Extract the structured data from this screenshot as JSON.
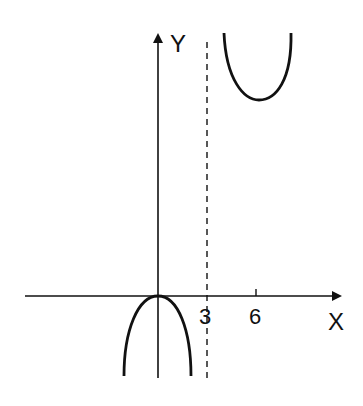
{
  "diagram": {
    "type": "function-graph-sketch",
    "axes": {
      "x_label": "X",
      "y_label": "Y"
    },
    "ticks": [
      {
        "label": "3",
        "x_value": 3
      },
      {
        "label": "6",
        "x_value": 6
      }
    ],
    "asymptote": {
      "type": "vertical",
      "x_value": 3,
      "style": "dashed"
    },
    "curves": [
      {
        "name": "lower-branch",
        "shape": "downward-parabola",
        "vertex": [
          0,
          0
        ],
        "domain": "x < 3"
      },
      {
        "name": "upper-branch",
        "shape": "upward-parabola",
        "local_minimum_x": 6,
        "domain": "x > 3"
      }
    ],
    "colors": {
      "stroke": "#111111",
      "background": "#ffffff"
    }
  }
}
